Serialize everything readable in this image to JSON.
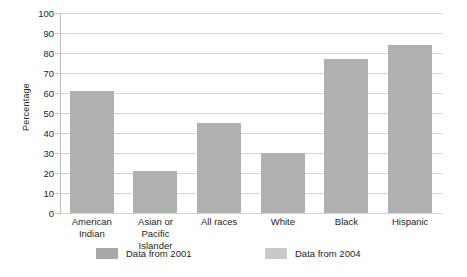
{
  "chart_data": {
    "type": "bar",
    "title": "",
    "subtitle": "",
    "xlabel": "",
    "ylabel": "Percentage",
    "ylim": [
      0,
      100
    ],
    "ytick_step": 10,
    "yticks": [
      100,
      90,
      80,
      70,
      60,
      50,
      40,
      30,
      20,
      10,
      0
    ],
    "grid": true,
    "legend_position": "bottom",
    "categories": [
      "American\nIndian",
      "Asian or\nPacific Islander",
      "All races",
      "White",
      "Black",
      "Hispanic"
    ],
    "category_lines": [
      [
        "American",
        "Indian"
      ],
      [
        "Asian or",
        "Pacific Islander"
      ],
      [
        "All races"
      ],
      [
        "White"
      ],
      [
        "Black"
      ],
      [
        "Hispanic"
      ]
    ],
    "series": [
      {
        "name": "Data from 2001",
        "color": "#b0b0b0",
        "values": [
          61,
          21,
          45,
          30,
          77,
          84
        ]
      }
    ],
    "legend": [
      {
        "label": "Data from 2001",
        "color": "#a8a8a8"
      },
      {
        "label": "Data from 2004",
        "color": "#c9c9c9"
      }
    ],
    "colors": {
      "bar": "#b0b0b0",
      "gridline": "#d4d4d4",
      "axis": "#bcbcbc",
      "text": "#231f20",
      "background": "#ffffff"
    }
  }
}
